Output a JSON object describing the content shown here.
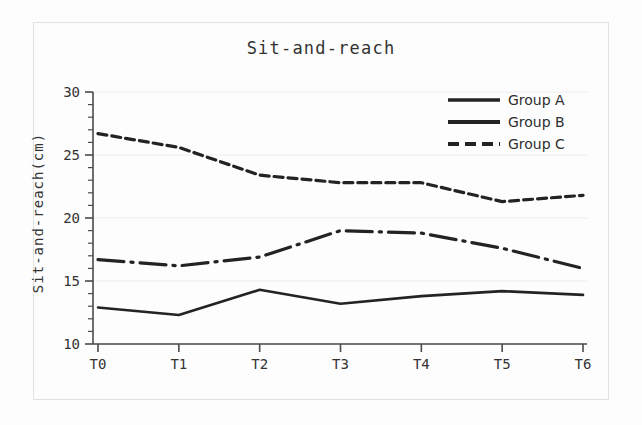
{
  "figure": {
    "title": "Sit-and-reach",
    "background": "#fdfdfd",
    "frame_color": "#e2e2e2"
  },
  "axes": {
    "ylabel": "Sit-and-reach(cm)",
    "xlabel": "",
    "y_ticks": [
      "10",
      "15",
      "20",
      "25",
      "30"
    ],
    "x_ticks": [
      "T0",
      "T1",
      "T2",
      "T3",
      "T4",
      "T5",
      "T6"
    ]
  },
  "legend": {
    "position": "top-right",
    "entries": [
      {
        "label": "Group A",
        "style": "solid",
        "color": "#232323"
      },
      {
        "label": "Group B",
        "style": "dashdot",
        "color": "#232323"
      },
      {
        "label": "Group C",
        "style": "dashed",
        "color": "#232323"
      }
    ]
  },
  "chart_data": {
    "type": "line",
    "title": "Sit-and-reach",
    "xlabel": "",
    "ylabel": "Sit-and-reach(cm)",
    "categories": [
      "T0",
      "T1",
      "T2",
      "T3",
      "T4",
      "T5",
      "T6"
    ],
    "ylim": [
      10,
      30
    ],
    "yticks": [
      10,
      15,
      20,
      25,
      30
    ],
    "grid": true,
    "legend_position": "top-right",
    "series": [
      {
        "name": "Group A",
        "style": "solid",
        "color": "#232323",
        "values": [
          12.9,
          12.3,
          14.3,
          13.2,
          13.8,
          14.2,
          13.9
        ]
      },
      {
        "name": "Group B",
        "style": "dashdot",
        "color": "#232323",
        "values": [
          16.7,
          16.2,
          16.9,
          19.0,
          18.8,
          17.6,
          16.0
        ]
      },
      {
        "name": "Group C",
        "style": "dashed",
        "color": "#232323",
        "values": [
          26.7,
          25.6,
          23.4,
          22.8,
          22.8,
          21.3,
          21.8
        ]
      }
    ]
  }
}
